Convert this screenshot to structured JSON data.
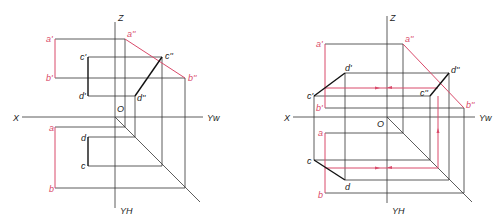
{
  "header": {
    "text": "…"
  },
  "figures": [
    {
      "name": "left-projection",
      "axes": {
        "z": "Z",
        "x": "X",
        "yw": "Yw",
        "yh": "YH",
        "origin": "O"
      },
      "points": {
        "a_prime": "a'",
        "b_prime": "b'",
        "c_prime": "c'",
        "d_prime": "d'",
        "a_dprime": "a''",
        "b_dprime": "b''",
        "c_dprime": "c''",
        "d_dprime": "d''",
        "a": "a",
        "b": "b",
        "c": "c",
        "d": "d"
      }
    },
    {
      "name": "right-projection",
      "axes": {
        "z": "Z",
        "x": "X",
        "yw": "Yw",
        "yh": "YH",
        "origin": "O"
      },
      "points": {
        "a_prime": "a'",
        "b_prime": "b'",
        "c_prime": "c'",
        "d_prime": "d'",
        "a_dprime": "a''",
        "b_dprime": "b''",
        "c_dprime": "c''",
        "d_dprime": "d''",
        "a": "a",
        "b": "b",
        "c": "c",
        "d": "d"
      }
    }
  ],
  "colors": {
    "line": "#333333",
    "highlight": "#d94a6a",
    "segment": "#111111"
  }
}
